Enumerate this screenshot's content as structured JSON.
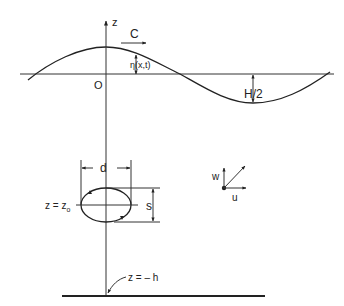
{
  "diagram": {
    "type": "wave-kinematics-schematic",
    "labels": {
      "z_axis": "z",
      "celerity": "C",
      "origin": "O",
      "surface_elevation": "η(x,t)",
      "half_height": "H/2",
      "orbit_width": "d",
      "orbit_height": "s",
      "orbit_depth": "z = z",
      "orbit_depth_sub": "o",
      "velocity_vertical": "w",
      "velocity_horizontal": "u",
      "seabed": "z = – h"
    },
    "colors": {
      "ink": "#222222",
      "background": "#ffffff"
    }
  }
}
